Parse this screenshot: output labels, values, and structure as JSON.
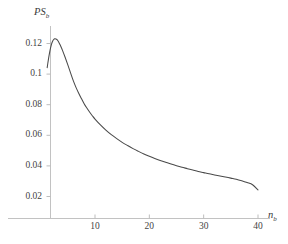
{
  "chart_data": {
    "type": "line",
    "title": "",
    "subtitle": "",
    "xlabel": "n_b",
    "ylabel": "PS_b",
    "xlabel_base": "n",
    "xlabel_sub": "b",
    "ylabel_base": "PS",
    "ylabel_sub": "b",
    "xlim": [
      0,
      42
    ],
    "ylim": [
      0,
      0.131
    ],
    "grid": false,
    "legend": null,
    "line_color": "#4a4a4a",
    "axis_color": "#bdbdbd",
    "xticks": [
      10,
      20,
      30,
      40
    ],
    "xtick_labels": [
      "10",
      "20",
      "30",
      "40"
    ],
    "yticks": [
      0.02,
      0.04,
      0.06,
      0.08,
      0.1,
      0.12
    ],
    "ytick_labels": [
      "0.02",
      "0.04",
      "0.06",
      "0.08",
      "0.1",
      "0.12"
    ],
    "series": [
      {
        "name": "PS_b",
        "x": [
          1.2,
          1.4,
          1.6,
          1.8,
          2.0,
          2.2,
          2.4,
          2.6,
          2.8,
          3.0,
          3.2,
          3.4,
          3.6,
          3.8,
          4.0,
          4.5,
          5.0,
          5.5,
          6.0,
          6.5,
          7.0,
          7.5,
          8.0,
          8.5,
          9.0,
          9.5,
          10.0,
          11.0,
          12.0,
          13.0,
          14.0,
          15.0,
          16.0,
          17.0,
          18.0,
          19.0,
          20.0,
          21.0,
          22.0,
          23.0,
          24.0,
          25.0,
          26.0,
          27.0,
          28.0,
          29.0,
          30.0,
          31.0,
          32.0,
          33.0,
          34.0,
          35.0,
          36.0,
          37.0,
          38.0,
          39.0,
          40.0
        ],
        "y": [
          0.1042,
          0.109,
          0.1132,
          0.1168,
          0.1196,
          0.1215,
          0.1226,
          0.1231,
          0.123,
          0.1225,
          0.1216,
          0.1204,
          0.119,
          0.1174,
          0.1157,
          0.111,
          0.106,
          0.1008,
          0.0957,
          0.0913,
          0.0875,
          0.084,
          0.0806,
          0.0778,
          0.0752,
          0.0728,
          0.0706,
          0.0668,
          0.0634,
          0.0604,
          0.0578,
          0.0554,
          0.0533,
          0.0513,
          0.0495,
          0.0478,
          0.0463,
          0.0449,
          0.0436,
          0.0424,
          0.0412,
          0.0401,
          0.0391,
          0.0382,
          0.0373,
          0.0364,
          0.0356,
          0.0348,
          0.0341,
          0.0334,
          0.0327,
          0.032,
          0.0313,
          0.0303,
          0.0291,
          0.0277,
          0.0243
        ]
      }
    ],
    "peak": {
      "x": 2.6,
      "y": 0.1231
    },
    "endpoint": {
      "x": 40.0,
      "y": 0.0243
    },
    "start_point": {
      "x": 1.2,
      "y": 0.1042
    }
  }
}
